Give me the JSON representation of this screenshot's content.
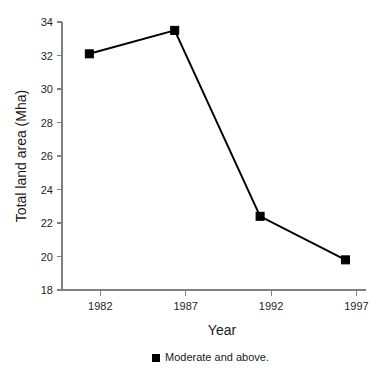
{
  "chart_data": {
    "type": "line",
    "title": "",
    "xlabel": "Year",
    "ylabel": "Total land area (Mha)",
    "x": [
      1982,
      1987,
      1992,
      1997
    ],
    "xtick_labels": [
      "1982",
      "1987",
      "1992",
      "1997"
    ],
    "ytick_labels": [
      "18",
      "20",
      "22",
      "24",
      "26",
      "28",
      "30",
      "32",
      "34"
    ],
    "yticks": [
      18,
      20,
      22,
      24,
      26,
      28,
      30,
      32,
      34
    ],
    "ylim": [
      18,
      34
    ],
    "xlim": [
      1980.4,
      1998.2
    ],
    "grid": false,
    "legend_position": "bottom-center",
    "series": [
      {
        "name": "Moderate and above.",
        "marker": "square",
        "color": "#000000",
        "values": [
          32.1,
          33.5,
          22.4,
          19.8
        ]
      }
    ]
  },
  "legend": {
    "entries": [
      {
        "label": "Moderate and above."
      }
    ]
  },
  "axes": {
    "x_title": "Year",
    "y_title": "Total land area (Mha)"
  }
}
